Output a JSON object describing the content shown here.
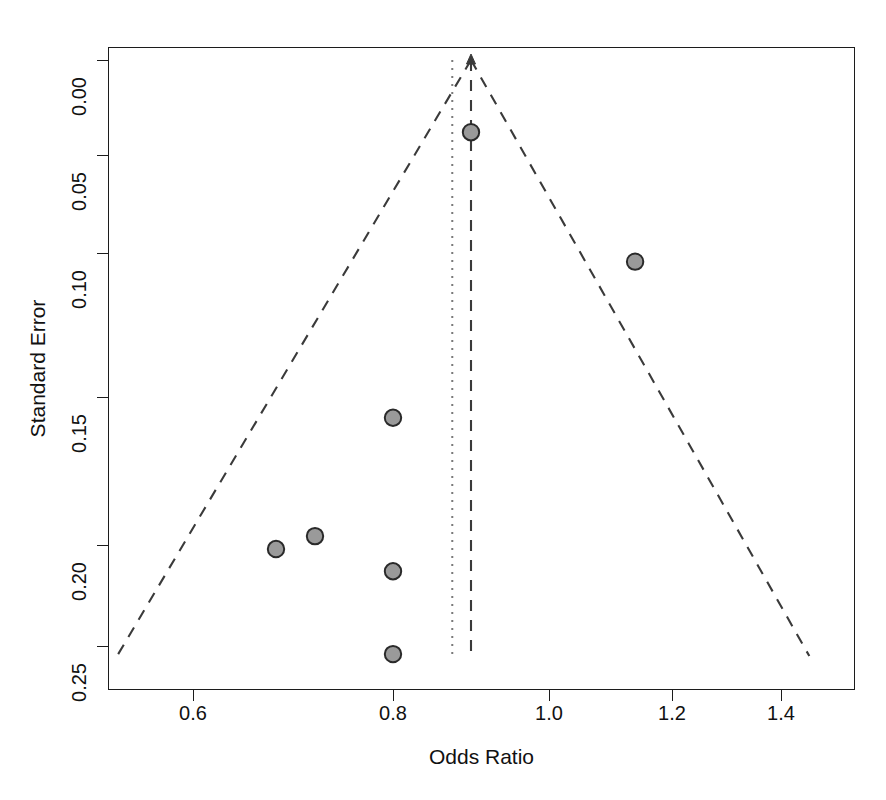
{
  "chart_data": {
    "type": "scatter",
    "title": "",
    "subtitle": "",
    "xlabel": "Odds Ratio",
    "ylabel": "Standard Error",
    "xlim": [
      0.5,
      1.47
    ],
    "ylim": [
      0.265,
      -0.008
    ],
    "y_axis_inverted": true,
    "grid": false,
    "legend": null,
    "xticks": [
      0.6,
      0.8,
      1.0,
      1.2,
      1.4
    ],
    "xtick_labels": [
      "0.6",
      "0.8",
      "1.0",
      "1.2",
      "1.4"
    ],
    "yticks": [
      0.0,
      0.05,
      0.1,
      0.15,
      0.2,
      0.25
    ],
    "ytick_labels": [
      "0.00",
      "0.05",
      "0.10",
      "0.15",
      "0.20",
      "0.25"
    ],
    "series": [
      {
        "name": "studies",
        "marker": "filled-circle",
        "marker_fill": "#9a9a9a",
        "marker_edge": "#2a2a2a",
        "points": [
          {
            "x": 0.9,
            "y": 0.038,
            "label": "study-1"
          },
          {
            "x": 1.14,
            "y": 0.103,
            "label": "study-2"
          },
          {
            "x": 0.8,
            "y": 0.157,
            "label": "study-3"
          },
          {
            "x": 0.8,
            "y": 0.213,
            "label": "study-4"
          },
          {
            "x": 0.722,
            "y": 0.197,
            "label": "study-5"
          },
          {
            "x": 0.683,
            "y": 0.202,
            "label": "study-6"
          },
          {
            "x": 0.8,
            "y": 0.254,
            "label": "study-7"
          }
        ]
      }
    ],
    "reference_lines": [
      {
        "name": "pooled-effect-line",
        "orientation": "vertical",
        "x": 0.9,
        "style": "dashed",
        "color": "#3a3a3a",
        "has_arrow_top": true
      },
      {
        "name": "null-reference-line",
        "orientation": "vertical",
        "x": 0.876,
        "style": "dotted",
        "color": "#7a7a7a"
      }
    ],
    "funnel": {
      "name": "pseudo-95pct-confidence-limits",
      "style": "dashed",
      "color": "#3a3a3a",
      "apex_x": 0.9,
      "apex_y": 0.0,
      "left_base_x": 0.524,
      "right_base_x": 1.452,
      "base_y": 0.255
    }
  },
  "axes": {
    "x_title": "Odds Ratio",
    "y_title": "Standard Error"
  },
  "colors": {
    "axis": "#1c1c1c",
    "marker_fill": "#9a9a9a",
    "marker_edge": "#2a2a2a",
    "dashed_line": "#3a3a3a",
    "dotted_line": "#7a7a7a",
    "background": "#ffffff"
  }
}
